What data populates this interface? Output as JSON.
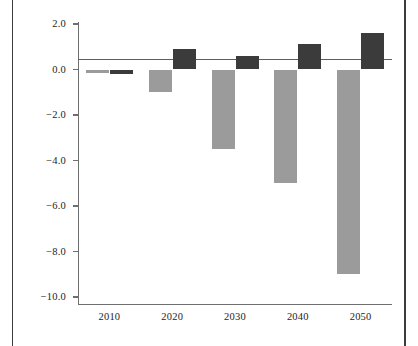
{
  "figure": {
    "background_color": "#ffffff",
    "frame_rule_color": "#3c3c3c"
  },
  "chart_data": {
    "type": "bar",
    "title": "",
    "subtitle": "",
    "xlabel": "",
    "ylabel": "percent of gross domestic product",
    "categories": [
      "2010",
      "2020",
      "2030",
      "2040",
      "2050"
    ],
    "series": [
      {
        "name": "gray-series",
        "color": "#9b9b9b",
        "values": [
          -0.15,
          -1.0,
          -3.5,
          -5.0,
          -9.0
        ]
      },
      {
        "name": "dark-series",
        "color": "#3b3b3b",
        "values": [
          -0.2,
          0.9,
          0.6,
          1.1,
          1.6
        ]
      }
    ],
    "ylim": [
      -10.0,
      2.0
    ],
    "yticks": [
      2.0,
      0.0,
      -2.0,
      -4.0,
      -6.0,
      -8.0,
      -10.0
    ],
    "ytick_labels": [
      "2.0",
      "0.0",
      "-2.0",
      "-4.0",
      "-6.0",
      "-8.0",
      "-10.0"
    ],
    "xtick_labels": [
      "2010",
      "2020",
      "2030",
      "2040",
      "2050"
    ],
    "grid": false,
    "zero_reference_line": 0.45,
    "zero_reference_line_color": "#5e5e5e",
    "legend": "none",
    "axis_color": "#6f6f6f"
  }
}
